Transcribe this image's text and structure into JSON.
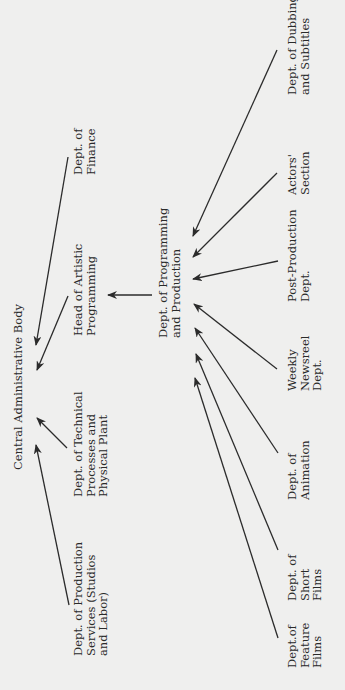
{
  "diagram": {
    "type": "org-chart",
    "orientation": "rotated-90-ccw",
    "background": "#efefee",
    "ink": "#2b2b2b",
    "nodes": [
      {
        "id": "central",
        "lines": [
          "Central Administrative Body"
        ],
        "x": 22,
        "y": 470
      },
      {
        "id": "finance",
        "lines": [
          "Dept. of",
          "Finance"
        ],
        "x": 82,
        "y": 175
      },
      {
        "id": "artistic",
        "lines": [
          "Head of Artistic",
          "Programming"
        ],
        "x": 82,
        "y": 336
      },
      {
        "id": "technical",
        "lines": [
          "Dept. of Technical",
          "Processes and",
          "Physical Plant"
        ],
        "x": 82,
        "y": 497
      },
      {
        "id": "prodservices",
        "lines": [
          "Dept. of Production",
          "Services (Studios",
          "and Labor)"
        ],
        "x": 82,
        "y": 656
      },
      {
        "id": "programming",
        "lines": [
          "Dept. of Programming",
          "and Production"
        ],
        "x": 167,
        "y": 338
      },
      {
        "id": "dubbing",
        "lines": [
          "Dept. of Dubbing",
          "and Subtitles"
        ],
        "x": 296,
        "y": 95
      },
      {
        "id": "actors",
        "lines": [
          "Actors'",
          "Section"
        ],
        "x": 296,
        "y": 195
      },
      {
        "id": "postproduction",
        "lines": [
          "Post-Production",
          "Dept."
        ],
        "x": 296,
        "y": 302
      },
      {
        "id": "newsreel",
        "lines": [
          "Weekly",
          "Newsreel",
          "Dept."
        ],
        "x": 296,
        "y": 391
      },
      {
        "id": "animation",
        "lines": [
          "Dept. of",
          "Animation"
        ],
        "x": 296,
        "y": 500
      },
      {
        "id": "shortfilms",
        "lines": [
          "Dept. of",
          "Short",
          "Films"
        ],
        "x": 296,
        "y": 601
      },
      {
        "id": "featurefilms",
        "lines": [
          "Dept.of",
          "Feature",
          "Films"
        ],
        "x": 296,
        "y": 668
      }
    ],
    "edges": [
      {
        "from": "finance",
        "to": "central",
        "x1": 68,
        "y1": 157,
        "x2": 36,
        "y2": 345
      },
      {
        "from": "artistic",
        "to": "central",
        "x1": 68,
        "y1": 296,
        "x2": 37,
        "y2": 370
      },
      {
        "from": "technical",
        "to": "central",
        "x1": 67,
        "y1": 448,
        "x2": 37,
        "y2": 418
      },
      {
        "from": "prodservices",
        "to": "central",
        "x1": 69,
        "y1": 605,
        "x2": 36,
        "y2": 445
      },
      {
        "from": "programming",
        "to": "artistic",
        "x1": 152,
        "y1": 295,
        "x2": 108,
        "y2": 295
      },
      {
        "from": "dubbing",
        "to": "programming",
        "x1": 277,
        "y1": 50,
        "x2": 193,
        "y2": 236
      },
      {
        "from": "actors",
        "to": "programming",
        "x1": 277,
        "y1": 173,
        "x2": 193,
        "y2": 257
      },
      {
        "from": "postproduction",
        "to": "programming",
        "x1": 278,
        "y1": 261,
        "x2": 193,
        "y2": 279
      },
      {
        "from": "newsreel",
        "to": "programming",
        "x1": 277,
        "y1": 369,
        "x2": 194,
        "y2": 304
      },
      {
        "from": "animation",
        "to": "programming",
        "x1": 278,
        "y1": 453,
        "x2": 195,
        "y2": 328
      },
      {
        "from": "shortfilms",
        "to": "programming",
        "x1": 278,
        "y1": 550,
        "x2": 196,
        "y2": 354
      },
      {
        "from": "featurefilms",
        "to": "programming",
        "x1": 278,
        "y1": 638,
        "x2": 195,
        "y2": 378
      }
    ],
    "line_spacing": 12.5
  }
}
